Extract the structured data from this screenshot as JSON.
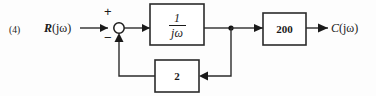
{
  "figure": {
    "problem_number": "(4)",
    "type": "control-system-block-diagram"
  },
  "labels": {
    "input_var": "R",
    "input_arg": "(jω)",
    "output_var": "C",
    "output_arg": "(jω)"
  },
  "summing_junction": {
    "plus_sign": "+",
    "minus_sign": "−"
  },
  "blocks": {
    "integrator": {
      "numerator": "1",
      "denominator": "jω"
    },
    "gain": {
      "value": "200"
    },
    "feedback": {
      "value": "2"
    }
  },
  "colors": {
    "line": "#2b2b2b",
    "text": "#1a1a1a",
    "background": "#fdfdfd"
  }
}
